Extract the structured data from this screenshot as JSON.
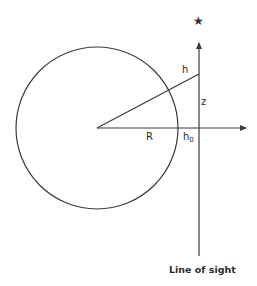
{
  "diagram": {
    "labels": {
      "h": "h",
      "z": "z",
      "R": "R",
      "h0_base": "h",
      "h0_sub": "0",
      "line_of_sight": "Line of sight"
    },
    "icons": {
      "star": "★"
    },
    "colors": {
      "stroke": "#3a3a3a",
      "text": "#2a2a2a",
      "background": "#ffffff"
    },
    "geometry": {
      "circle": {
        "cx": 97,
        "cy": 128,
        "r": 81
      },
      "horizontal_axis": {
        "x1": 97,
        "y1": 128,
        "x2": 248,
        "y2": 128
      },
      "line_of_sight": {
        "x": 199,
        "y_top": 41,
        "y_bottom": 256
      },
      "slant_line": {
        "x1": 97,
        "y1": 128,
        "x2": 199,
        "y2": 74
      },
      "star_center": {
        "x": 199,
        "y": 22
      }
    }
  }
}
